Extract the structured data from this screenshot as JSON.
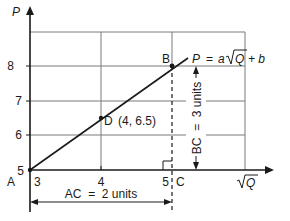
{
  "diagram": {
    "y_axis_label": "P",
    "x_axis_label": "Q",
    "x_axis_label_has_sqrt": true,
    "y_ticks": [
      "5",
      "6",
      "7",
      "8"
    ],
    "x_ticks": [
      "3",
      "4",
      "5"
    ],
    "equation": {
      "lhs": "P",
      "eq": "=",
      "coef": "a",
      "radicand": "Q",
      "rest": "+ b"
    },
    "points": {
      "A": {
        "label": "A",
        "x": 3,
        "y": 5
      },
      "B": {
        "label": "B",
        "x": 5,
        "y": 8
      },
      "C": {
        "label": "C",
        "x": 5,
        "y": 5
      },
      "D": {
        "label": "D",
        "x": 4,
        "y": 6.5,
        "annotation": "(4, 6.5)"
      }
    },
    "dimensions": {
      "ac": "AC  =  2 units",
      "bc": "BC  =  3 units"
    }
  }
}
